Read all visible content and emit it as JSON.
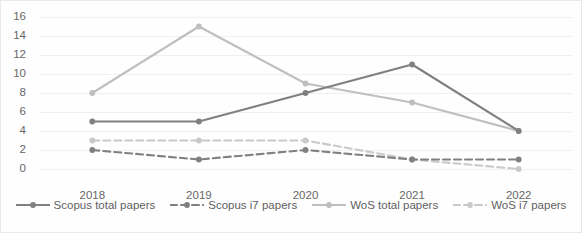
{
  "chart_data": {
    "type": "line",
    "title": "",
    "xlabel": "",
    "ylabel": "",
    "x": [
      "2018",
      "2019",
      "2020",
      "2021",
      "2022"
    ],
    "categories": [
      "2018",
      "2019",
      "2020",
      "2021",
      "2022"
    ],
    "ylim": [
      0,
      16
    ],
    "ytick_step": 2,
    "yticks": [
      16,
      14,
      12,
      10,
      8,
      6,
      4,
      2,
      0
    ],
    "grid": true,
    "legend_position": "bottom",
    "series": [
      {
        "name": "Scopus total papers",
        "values": [
          5,
          5,
          8,
          11,
          4
        ],
        "color": "#808080",
        "style": "solid",
        "marker": "circle"
      },
      {
        "name": "Scopus i7 papers",
        "values": [
          2,
          1,
          2,
          1,
          1
        ],
        "color": "#808080",
        "style": "dashed",
        "marker": "circle"
      },
      {
        "name": "WoS total papers",
        "values": [
          8,
          15,
          9,
          7,
          4
        ],
        "color": "#bfbfbf",
        "style": "solid",
        "marker": "circle"
      },
      {
        "name": "WoS i7 papers",
        "values": [
          3,
          3,
          3,
          1,
          0
        ],
        "color": "#c9c9c9",
        "style": "dashed",
        "marker": "circle"
      }
    ]
  },
  "axis": {
    "ytick_labels": [
      "16",
      "14",
      "12",
      "10",
      "8",
      "6",
      "4",
      "2",
      "0"
    ],
    "xtick_labels": [
      "2018",
      "2019",
      "2020",
      "2021",
      "2022"
    ]
  },
  "legend": {
    "items": [
      {
        "label": "Scopus total papers"
      },
      {
        "label": "Scopus i7 papers"
      },
      {
        "label": "WoS total papers"
      },
      {
        "label": "WoS i7 papers"
      }
    ]
  },
  "colors": {
    "grid": "#eef0f1",
    "border": "#e9e9ea",
    "text": "#676767",
    "dark_series": "#808080",
    "light_series": "#bfbfbf"
  }
}
